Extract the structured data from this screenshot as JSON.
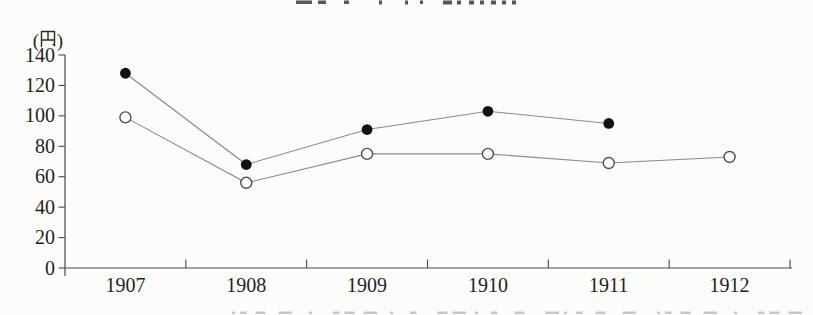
{
  "page": {
    "background": "#fcfcfb",
    "note": "Scanned book page chart. A title line is cropped at the top edge and a caption line is cropped at the bottom edge; only illegible character fragments of each remain visible."
  },
  "chart_data": {
    "type": "line",
    "x": [
      "1907",
      "1908",
      "1909",
      "1910",
      "1911",
      "1912"
    ],
    "series": [
      {
        "name": "upper-series",
        "marker": "filled-circle",
        "values": [
          128,
          68,
          91,
          103,
          95,
          null
        ]
      },
      {
        "name": "lower-series",
        "marker": "open-circle",
        "values": [
          99,
          56,
          75,
          75,
          69,
          73
        ]
      }
    ],
    "title": "",
    "xlabel": "",
    "ylabel": "(円)",
    "ylim": [
      0,
      140
    ],
    "y_ticks": [
      0,
      20,
      40,
      60,
      80,
      100,
      120,
      140
    ],
    "grid": false,
    "legend": "none"
  },
  "labels": {
    "y_unit": "(円)"
  },
  "colors": {
    "background": "#fcfcfb",
    "axis": "#4a4a4a",
    "line": "#8a8a8a",
    "marker_filled": "#111111",
    "marker_open_fill": "#ffffff",
    "marker_open_stroke": "#4f4f4f",
    "text": "#1f1f1f",
    "fragment_dark": "#3a3a3a",
    "fragment_light": "#c8c8c3"
  }
}
